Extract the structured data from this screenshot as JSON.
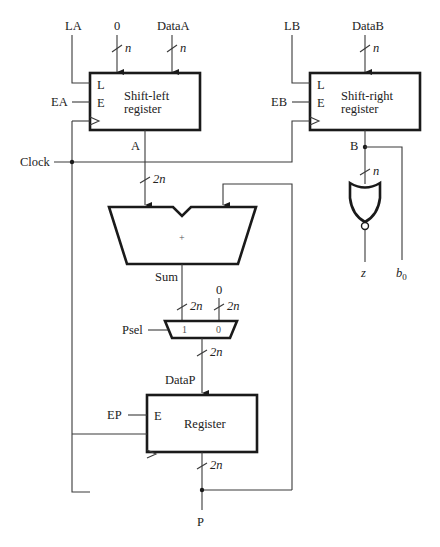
{
  "diagram": {
    "type": "datapath circuit (shift-and-add multiplier)",
    "inputs": {
      "la": "LA",
      "zero_top": "0",
      "data_a": "DataA",
      "lb": "LB",
      "data_b": "DataB",
      "ea": "EA",
      "eb": "EB",
      "clock": "Clock",
      "psel": "Psel",
      "ep": "EP",
      "zero_mux": "0"
    },
    "blocks": {
      "shift_left": {
        "line1": "Shift-left",
        "line2": "register",
        "pin_l": "L",
        "pin_e": "E"
      },
      "shift_right": {
        "line1": "Shift-right",
        "line2": "register",
        "pin_l": "L",
        "pin_e": "E"
      },
      "adder": {
        "symbol": "+"
      },
      "mux": {
        "in1": "1",
        "in0": "0"
      },
      "register": {
        "label": "Register",
        "pin_e": "E"
      },
      "nor_gate": {
        "type": "NOR"
      }
    },
    "signals": {
      "a": "A",
      "b": "B",
      "sum": "Sum",
      "datap": "DataP",
      "p": "P",
      "z": "z",
      "b0_base": "b",
      "b0_sub": "0"
    },
    "bus_widths": {
      "n": "n",
      "two_n": "2n"
    }
  }
}
